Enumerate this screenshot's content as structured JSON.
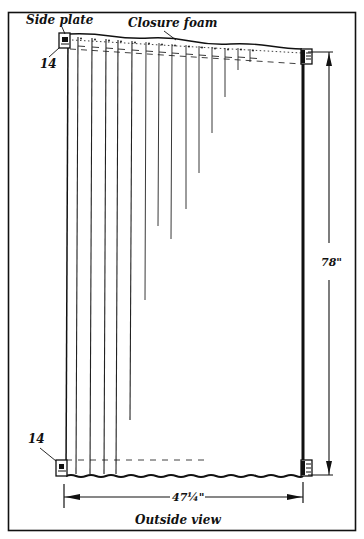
{
  "labels": {
    "side_plate": "Side plate",
    "closure_foam": "Closure foam",
    "callout_top": "14",
    "callout_bottom": "14",
    "height_dimension": "78\"",
    "width_dimension": "47¼\"",
    "caption": "Outside view"
  },
  "dimensions": {
    "height_in": 78,
    "width_in": 47.25
  },
  "vertical_lines": {
    "count": 14,
    "description": "fins decreasing in length from left to right",
    "full_length_lines": 5
  },
  "colors": {
    "ink": "#111111",
    "paper": "#ffffff"
  }
}
